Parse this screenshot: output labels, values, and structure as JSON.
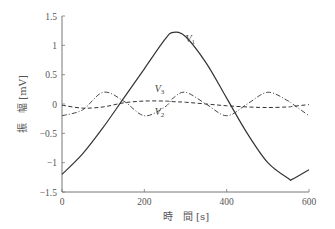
{
  "chart_data": {
    "type": "line",
    "title": "",
    "xlabel": "時　間 [s]",
    "ylabel": "振　幅 [mV]",
    "xlim": [
      0,
      600
    ],
    "ylim": [
      -1.5,
      1.5
    ],
    "xticks": [
      "0",
      "200",
      "400",
      "600"
    ],
    "yticks": [
      "1.5",
      "1",
      "0.5",
      "0",
      "−0.5",
      "−1",
      "−1.5"
    ],
    "grid": false,
    "legend": "inline labels",
    "x": [
      0,
      50,
      100,
      150,
      200,
      250,
      270,
      300,
      350,
      400,
      450,
      500,
      550,
      560,
      600
    ],
    "series": [
      {
        "name": "V1",
        "style": "solid",
        "values": [
          -1.2,
          -0.85,
          -0.4,
          0.1,
          0.6,
          1.1,
          1.22,
          1.15,
          0.7,
          0.1,
          -0.5,
          -1.0,
          -1.27,
          -1.28,
          -1.12
        ]
      },
      {
        "name": "V2",
        "style": "dashed",
        "values": [
          -0.02,
          -0.07,
          -0.05,
          0.02,
          0.05,
          0.05,
          0.04,
          0.03,
          0.0,
          -0.03,
          -0.05,
          -0.06,
          -0.05,
          -0.04,
          -0.01
        ]
      },
      {
        "name": "V3",
        "style": "dash-dot",
        "values": [
          -0.2,
          -0.1,
          0.2,
          0.05,
          -0.2,
          -0.05,
          0.1,
          0.2,
          0.0,
          -0.2,
          0.0,
          0.2,
          0.05,
          0.0,
          -0.2
        ]
      }
    ],
    "annotations": [
      {
        "text": "V1",
        "x": 300,
        "y": 1.05
      },
      {
        "text": "V3",
        "x": 225,
        "y": 0.2
      },
      {
        "text": "V2",
        "x": 225,
        "y": -0.18
      }
    ]
  },
  "labels": {
    "V1_main": "V",
    "V1_sub": "1",
    "V2_main": "V",
    "V2_sub": "2",
    "V3_main": "V",
    "V3_sub": "3"
  }
}
